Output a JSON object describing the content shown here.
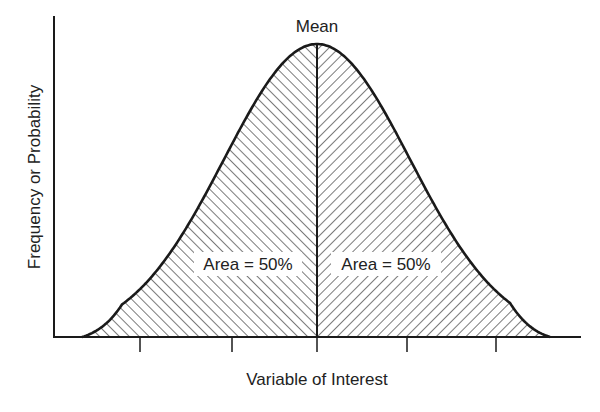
{
  "chart_data": {
    "type": "area",
    "title": "",
    "xlabel": "Variable of Interest",
    "ylabel": "Frequency or Probability",
    "annotations": {
      "peak_label": "Mean",
      "left_area_label": "Area = 50%",
      "right_area_label": "Area = 50%"
    },
    "x_ticks": 5,
    "tick_labels": [],
    "grid": false,
    "legend": null,
    "distribution": {
      "shape": "normal",
      "mean_position": "center",
      "left_area_pct": 50,
      "right_area_pct": 50
    }
  },
  "labels": {
    "mean": "Mean",
    "left_area": "Area = 50%",
    "right_area": "Area = 50%",
    "x_axis": "Variable of Interest",
    "y_axis": "Frequency or Probability"
  },
  "colors": {
    "line": "#1a1a1a",
    "hatch": "#333333",
    "background": "#ffffff"
  }
}
